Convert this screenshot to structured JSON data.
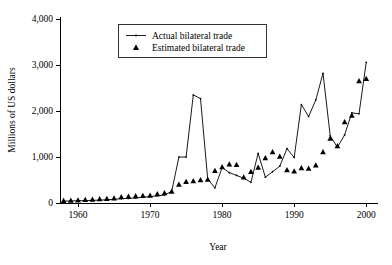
{
  "chart_data": {
    "type": "line",
    "title": "",
    "xlabel": "Year",
    "ylabel": "Millions of US dollars",
    "xlim": [
      1957.5,
      2000.8
    ],
    "ylim": [
      0,
      4000
    ],
    "grid": false,
    "legend_position": "top-center",
    "x_ticks": [
      "1960",
      "1970",
      "1980",
      "1990",
      "2000"
    ],
    "x_tick_values": [
      1960,
      1970,
      1980,
      1990,
      2000
    ],
    "y_ticks": [
      "0",
      "1,000",
      "2,000",
      "3,000",
      "4,000"
    ],
    "y_tick_values": [
      0,
      1000,
      2000,
      3000,
      4000
    ],
    "series": [
      {
        "name": "Actual bilateral trade",
        "marker": "line-with-dot",
        "x": [
          1958,
          1959,
          1960,
          1961,
          1962,
          1963,
          1964,
          1965,
          1966,
          1967,
          1968,
          1969,
          1970,
          1971,
          1972,
          1973,
          1974,
          1975,
          1976,
          1977,
          1978,
          1979,
          1980,
          1981,
          1982,
          1983,
          1984,
          1985,
          1986,
          1987,
          1988,
          1989,
          1990,
          1991,
          1992,
          1993,
          1994,
          1995,
          1996,
          1997,
          1998,
          1999,
          2000
        ],
        "values": [
          40,
          45,
          50,
          52,
          58,
          62,
          70,
          80,
          95,
          100,
          110,
          125,
          140,
          155,
          175,
          250,
          1000,
          1000,
          2350,
          2270,
          520,
          330,
          770,
          660,
          600,
          540,
          450,
          1080,
          560,
          680,
          800,
          1180,
          990,
          2140,
          1880,
          2240,
          2820,
          1460,
          1210,
          1480,
          1960,
          1940,
          3060
        ]
      },
      {
        "name": "Estimated bilateral trade",
        "marker": "triangle",
        "x": [
          1958,
          1959,
          1960,
          1961,
          1962,
          1963,
          1964,
          1965,
          1966,
          1967,
          1968,
          1969,
          1970,
          1971,
          1972,
          1973,
          1974,
          1975,
          1976,
          1977,
          1978,
          1979,
          1980,
          1981,
          1982,
          1983,
          1984,
          1985,
          1986,
          1987,
          1988,
          1989,
          1990,
          1991,
          1992,
          1993,
          1994,
          1995,
          1996,
          1997,
          1998,
          1999,
          2000
        ],
        "values": [
          50,
          55,
          62,
          70,
          78,
          85,
          95,
          105,
          130,
          140,
          150,
          158,
          165,
          195,
          215,
          250,
          400,
          460,
          480,
          500,
          510,
          700,
          780,
          840,
          830,
          560,
          680,
          770,
          980,
          1110,
          1010,
          720,
          690,
          760,
          750,
          820,
          1110,
          1400,
          1240,
          1760,
          1900,
          2650,
          2700
        ]
      }
    ]
  },
  "legend": {
    "items": [
      {
        "label": "Actual bilateral trade",
        "marker": "line-with-dot"
      },
      {
        "label": "Estimated bilateral trade",
        "marker": "triangle"
      }
    ]
  },
  "colors": {
    "axis": "#000000",
    "line": "#000000",
    "marker": "#000000",
    "background": "#ffffff"
  }
}
